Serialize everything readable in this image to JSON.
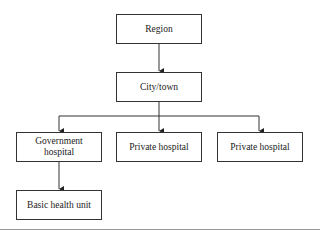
{
  "diagram": {
    "type": "hierarchy",
    "nodes": {
      "region": "Region",
      "city": "City/town",
      "government_hospital": "Government hospital",
      "private_hospital_1": "Private hospital",
      "private_hospital_2": "Private hospital",
      "basic_health_unit": "Basic health unit"
    },
    "edges": [
      [
        "Region",
        "City/town"
      ],
      [
        "City/town",
        "Government hospital"
      ],
      [
        "City/town",
        "Private hospital"
      ],
      [
        "City/town",
        "Private hospital"
      ],
      [
        "Government hospital",
        "Basic health unit"
      ]
    ]
  }
}
